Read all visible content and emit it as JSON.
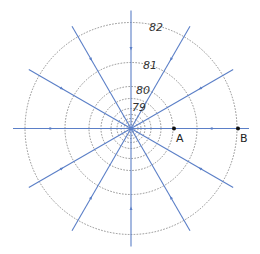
{
  "diagram": {
    "center": [
      131,
      128.5
    ],
    "colors": {
      "field_line": "#5b7fc7",
      "contour": "#777777",
      "label": "#333333",
      "point": "#111111"
    },
    "contours": [
      {
        "r": 4,
        "label": ""
      },
      {
        "r": 7,
        "label": ""
      },
      {
        "r": 10,
        "label": ""
      },
      {
        "r": 14,
        "label": ""
      },
      {
        "r": 20,
        "label": "79"
      },
      {
        "r": 30,
        "label": "80"
      },
      {
        "r": 42,
        "label": ""
      },
      {
        "r": 66,
        "label": "81"
      },
      {
        "r": 106,
        "label": "82"
      }
    ],
    "labels": [
      {
        "text": "82",
        "x": 149,
        "y": 31
      },
      {
        "text": "81",
        "x": 143,
        "y": 69
      },
      {
        "text": "80",
        "x": 136,
        "y": 94
      },
      {
        "text": "79",
        "x": 132,
        "y": 111
      }
    ],
    "field_lines": {
      "angles_deg": [
        0,
        30,
        60,
        90,
        120,
        150,
        180,
        210,
        240,
        270,
        300,
        330
      ],
      "length": 118,
      "arrow_at": 80,
      "arrow_direction": "inward"
    },
    "points": [
      {
        "name": "A",
        "x": 174,
        "y": 128.5,
        "label_x": 176,
        "label_y": 142
      },
      {
        "name": "B",
        "x": 238,
        "y": 128.5,
        "label_x": 240,
        "label_y": 142
      }
    ]
  }
}
